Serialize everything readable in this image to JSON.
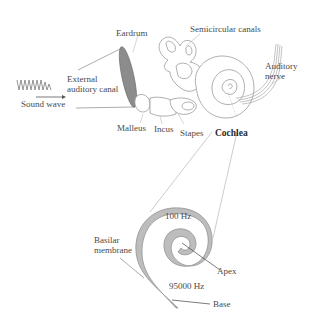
{
  "diagram": {
    "ear_labels": {
      "eardrum": "Eardrum",
      "semicircular_canals": "Semicircular canals",
      "auditory_nerve_line1": "Auditory",
      "auditory_nerve_line2": "nerve",
      "external_canal_line1": "External",
      "external_canal_line2": "auditory canal",
      "sound_wave": "Sound wave",
      "malleus": "Malleus",
      "incus": "Incus",
      "stapes": "Stapes",
      "cochlea": "Cochlea"
    },
    "cochlea_labels": {
      "basilar_line1": "Basilar",
      "basilar_line2": "membrane",
      "freq_low": "100 Hz",
      "freq_high": "95000 Hz",
      "apex": "Apex",
      "base": "Base"
    },
    "colors": {
      "line": "#9a9a9a",
      "fill_gray": "#bdbdbd",
      "eardrum_fill": "#8c8c8c",
      "text": "#4a4a4a"
    }
  }
}
